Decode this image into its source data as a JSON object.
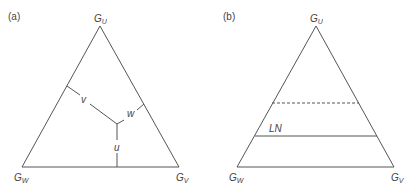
{
  "panels": [
    {
      "id": "a",
      "tag": "(a)",
      "vertices": {
        "top": {
          "label": "G",
          "sub": "U"
        },
        "left": {
          "label": "G",
          "sub": "W"
        },
        "right": {
          "label": "G",
          "sub": "V"
        }
      },
      "segments": [
        {
          "label": "v"
        },
        {
          "label": "w"
        },
        {
          "label": "u"
        }
      ]
    },
    {
      "id": "b",
      "tag": "(b)",
      "vertices": {
        "top": {
          "label": "G",
          "sub": "U"
        },
        "left": {
          "label": "G",
          "sub": "W"
        },
        "right": {
          "label": "G",
          "sub": "V"
        }
      },
      "lines": [
        {
          "style": "dashed",
          "label": ""
        },
        {
          "style": "solid",
          "label": "LN"
        }
      ]
    }
  ],
  "colors": {
    "stroke": "#555555",
    "text": "#444444",
    "background": "#ffffff"
  }
}
